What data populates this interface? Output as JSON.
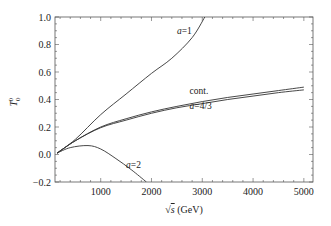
{
  "chart_data": {
    "type": "line",
    "title": "",
    "xlabel": "√s (GeV)",
    "ylabel": "T₀⁰",
    "xlim": [
      100,
      5180
    ],
    "ylim": [
      -0.2,
      1.0
    ],
    "grid": false,
    "legend": "none (inline curve labels)",
    "xticks": [
      1000,
      2000,
      3000,
      4000,
      5000
    ],
    "xtick_labels": [
      "1000",
      "2000",
      "3000",
      "4000",
      "5000"
    ],
    "yticks": [
      -0.2,
      0.0,
      0.2,
      0.4,
      0.6,
      0.8,
      1.0
    ],
    "ytick_labels": [
      "−0.2",
      "0.0",
      "0.2",
      "0.4",
      "0.6",
      "0.8",
      "1.0"
    ],
    "series": [
      {
        "name": "a=1",
        "label": "a=1",
        "x": [
          140,
          500,
          1000,
          1500,
          2000,
          2400,
          2800,
          3050
        ],
        "y": [
          0.01,
          0.11,
          0.29,
          0.44,
          0.59,
          0.7,
          0.85,
          1.0
        ]
      },
      {
        "name": "cont.",
        "label": "cont.",
        "x": [
          140,
          500,
          1000,
          1500,
          2000,
          2500,
          3000,
          3500,
          4000,
          4500,
          5000
        ],
        "y": [
          0.01,
          0.1,
          0.2,
          0.26,
          0.31,
          0.35,
          0.385,
          0.415,
          0.44,
          0.465,
          0.49
        ]
      },
      {
        "name": "a=4/3",
        "label": "a=4/3",
        "x": [
          140,
          500,
          1000,
          1500,
          2000,
          2500,
          3000,
          3500,
          4000,
          4500,
          5000
        ],
        "y": [
          0.01,
          0.1,
          0.195,
          0.25,
          0.3,
          0.34,
          0.37,
          0.4,
          0.425,
          0.45,
          0.47
        ]
      },
      {
        "name": "a=2",
        "label": "a=2",
        "x": [
          140,
          400,
          750,
          1000,
          1300,
          1600,
          1900
        ],
        "y": [
          0.01,
          0.05,
          0.065,
          0.04,
          -0.03,
          -0.11,
          -0.2
        ]
      }
    ],
    "annotations": [
      {
        "text": "a=1",
        "x": 2500,
        "y": 0.88
      },
      {
        "text": "cont.",
        "x": 2750,
        "y": 0.44
      },
      {
        "text": "a=4/3",
        "x": 2750,
        "y": 0.33
      },
      {
        "text": "a=2",
        "x": 1500,
        "y": -0.1
      }
    ]
  },
  "style": {
    "line_color": "#333333",
    "frame_color": "#555555"
  }
}
